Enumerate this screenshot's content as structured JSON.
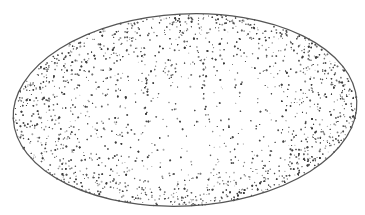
{
  "figure": {
    "width": 365,
    "height": 215,
    "background": "#ffffff",
    "ink": "#3a3a3a",
    "ellipse": {
      "cx": 185,
      "cy": 110,
      "rx": 172,
      "ry": 96,
      "rotate": -3
    },
    "outline_color": "#555555",
    "streaks": [
      {
        "x": 118,
        "y1": 70,
        "y2": 135
      },
      {
        "x": 147,
        "y1": 60,
        "y2": 135
      },
      {
        "x": 176,
        "y1": 58,
        "y2": 130
      },
      {
        "x": 205,
        "y1": 60,
        "y2": 128
      }
    ]
  }
}
